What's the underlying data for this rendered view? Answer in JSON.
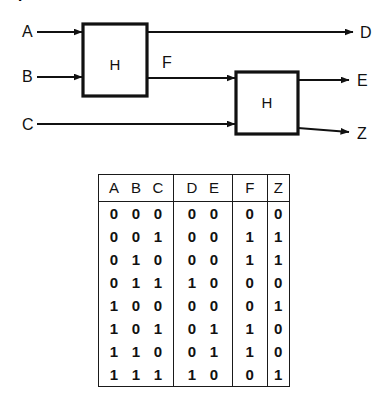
{
  "heading_fragment": "P",
  "diagram": {
    "blocks": [
      {
        "id": "h1",
        "label": "H"
      },
      {
        "id": "h2",
        "label": "H"
      }
    ],
    "inputs": [
      {
        "id": "a",
        "label": "A"
      },
      {
        "id": "b",
        "label": "B"
      },
      {
        "id": "c",
        "label": "C"
      }
    ],
    "outputs": [
      {
        "id": "d",
        "label": "D"
      },
      {
        "id": "e",
        "label": "E"
      },
      {
        "id": "z",
        "label": "Z"
      }
    ],
    "internal_signals": [
      {
        "id": "f",
        "label": "F"
      }
    ]
  },
  "truth_table": {
    "group_headers": [
      {
        "id": "abc",
        "labels": [
          "A",
          "B",
          "C"
        ]
      },
      {
        "id": "de",
        "labels": [
          "D",
          "E"
        ]
      },
      {
        "id": "f",
        "labels": [
          "F"
        ]
      },
      {
        "id": "z",
        "labels": [
          "Z"
        ]
      }
    ],
    "rows": [
      {
        "abc": [
          "0",
          "0",
          "0"
        ],
        "de": [
          "0",
          "0"
        ],
        "f": "0",
        "z": "0"
      },
      {
        "abc": [
          "0",
          "0",
          "1"
        ],
        "de": [
          "0",
          "0"
        ],
        "f": "1",
        "z": "1"
      },
      {
        "abc": [
          "0",
          "1",
          "0"
        ],
        "de": [
          "0",
          "0"
        ],
        "f": "1",
        "z": "1"
      },
      {
        "abc": [
          "0",
          "1",
          "1"
        ],
        "de": [
          "1",
          "0"
        ],
        "f": "0",
        "z": "0"
      },
      {
        "abc": [
          "1",
          "0",
          "0"
        ],
        "de": [
          "0",
          "0"
        ],
        "f": "0",
        "z": "1"
      },
      {
        "abc": [
          "1",
          "0",
          "1"
        ],
        "de": [
          "0",
          "1"
        ],
        "f": "1",
        "z": "0"
      },
      {
        "abc": [
          "1",
          "1",
          "0"
        ],
        "de": [
          "0",
          "1"
        ],
        "f": "1",
        "z": "0"
      },
      {
        "abc": [
          "1",
          "1",
          "1"
        ],
        "de": [
          "1",
          "0"
        ],
        "f": "0",
        "z": "1"
      }
    ]
  },
  "colors": {
    "ink": "#1a1a1a",
    "background": "#ffffff"
  }
}
